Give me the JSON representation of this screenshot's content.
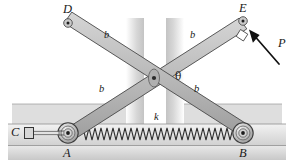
{
  "figure": {
    "background_color": "#ffffff",
    "bar_fill_color": "#bfbfbf",
    "bar_stroke_color": "#4a4a4a",
    "ground_color": "#d8d8d8",
    "shadow_color": "#cfcfcf",
    "label_color": "#1a1a1a"
  },
  "labels": {
    "vertex_d": "D",
    "vertex_e": "E",
    "vertex_a": "A",
    "vertex_b": "B",
    "vertex_c": "C",
    "force_p": "P",
    "angle_theta": "θ",
    "spring_k": "k",
    "bar_upper_left": "b",
    "bar_upper_right": "b",
    "bar_lower_left": "b",
    "bar_lower_right": "b"
  },
  "geometry": {
    "pivot": {
      "x": 154,
      "y": 78
    },
    "point_d": {
      "x": 68,
      "y": 23
    },
    "point_e": {
      "x": 243,
      "y": 21
    },
    "point_a": {
      "x": 68,
      "y": 133
    },
    "point_b": {
      "x": 243,
      "y": 133
    },
    "point_c": {
      "x": 23,
      "y": 133
    },
    "force_arrow_tail": {
      "x": 277,
      "y": 62
    },
    "force_arrow_head": {
      "x": 250,
      "y": 31
    },
    "ground_line_y": 146,
    "track_top_y": 124,
    "spring_left_x": 80,
    "spring_right_x": 236,
    "spring_center_y": 134,
    "spring_coils": 26
  },
  "annotations": {
    "right_angle_marker": "right-angle-symbol-at-E",
    "roller_a": "roller-support",
    "roller_b": "roller-support",
    "block_c": "slider-block"
  }
}
